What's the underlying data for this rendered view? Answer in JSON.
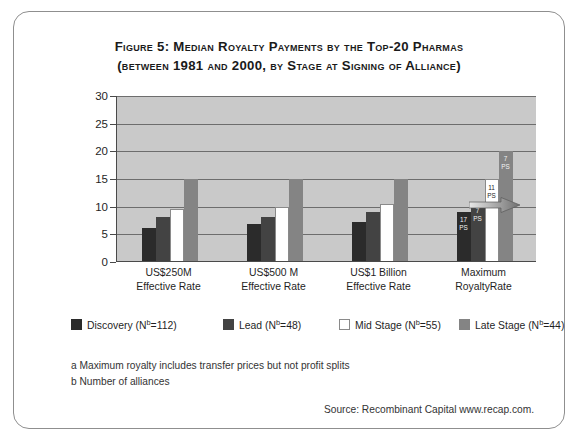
{
  "figure": {
    "title_line_1": "Figure 5:  Median Royalty Payments by the Top-20 Pharmas",
    "title_line_2": "(between 1981 and 2000, by Stage at Signing of Alliance)"
  },
  "footnotes": {
    "a": "a Maximum royalty includes transfer prices but not profit splits",
    "b": "b Number of alliances"
  },
  "source": {
    "text": "Source: Recombinant Capital www.recap.com."
  },
  "annotations": {
    "arrow": "right-arrow"
  },
  "colors": {
    "discovery": "#2b2b2b",
    "lead": "#434343",
    "mid_stage": "#ffffff",
    "late_stage": "#848484",
    "plot_background": "#c9c9c9",
    "gridline": "#6d6d6d",
    "axis": "#4a4a4a",
    "border": "#8f8f8f"
  },
  "chart_data": {
    "type": "bar",
    "title": "Figure 5:  Median Royalty Payments by the Top-20 Pharmas (between 1981 and 2000, by Stage at Signing of Alliance)",
    "xlabel": "",
    "ylabel": "",
    "ylim": [
      0,
      30
    ],
    "yticks": [
      0,
      5,
      10,
      15,
      20,
      25,
      30
    ],
    "ytick_labels": [
      "0",
      "5",
      "10",
      "15",
      "20",
      "25",
      "30"
    ],
    "grid": true,
    "legend_position": "bottom",
    "categories": [
      "US$250M\nEffective Rate",
      "US$500 M\nEffective Rate",
      "US$1 Billion\nEffective Rate",
      "Maximum\nRoyaltyRate"
    ],
    "category_lines": [
      [
        "US$250M",
        "Effective Rate"
      ],
      [
        "US$500 M",
        "Effective Rate"
      ],
      [
        "US$1 Billion",
        "Effective Rate"
      ],
      [
        "Maximum",
        "RoyaltyRate"
      ]
    ],
    "series": [
      {
        "name": "Discovery (Nᵇ=112)",
        "label": "Discovery",
        "n_label": "(Nᵇ=112)",
        "n": 112,
        "color": "#2b2b2b",
        "values": [
          6.2,
          6.8,
          7.3,
          9.0
        ],
        "point_labels": [
          null,
          null,
          null,
          "17\nPS"
        ]
      },
      {
        "name": "Lead (Nᵇ=48)",
        "label": "Lead",
        "n_label": "(Nᵇ=48)",
        "n": 48,
        "color": "#434343",
        "values": [
          8.2,
          8.1,
          9.0,
          10.7
        ],
        "point_labels": [
          null,
          null,
          null,
          "7\nPS"
        ]
      },
      {
        "name": "Mid Stage (Nᵇ=55)",
        "label": "Mid Stage",
        "n_label": "(Nᵇ=55)",
        "n": 55,
        "color": "#ffffff",
        "values": [
          9.5,
          10.0,
          10.5,
          15.0
        ],
        "point_labels": [
          null,
          null,
          null,
          "11\nPS"
        ]
      },
      {
        "name": "Late Stage (Nᵇ=44)",
        "label": "Late Stage",
        "n_label": "(Nᵇ=44)",
        "n": 44,
        "color": "#848484",
        "values": [
          15.0,
          15.0,
          15.0,
          20.0
        ],
        "point_labels": [
          null,
          null,
          null,
          "7\nPS"
        ]
      }
    ],
    "bar_annotations": {
      "group": "Maximum RoyaltyRate",
      "labels": [
        {
          "top": "17",
          "bottom": "PS"
        },
        {
          "top": "7",
          "bottom": "PS"
        },
        {
          "top": "11",
          "bottom": "PS"
        },
        {
          "top": "7",
          "bottom": "PS"
        }
      ]
    }
  }
}
